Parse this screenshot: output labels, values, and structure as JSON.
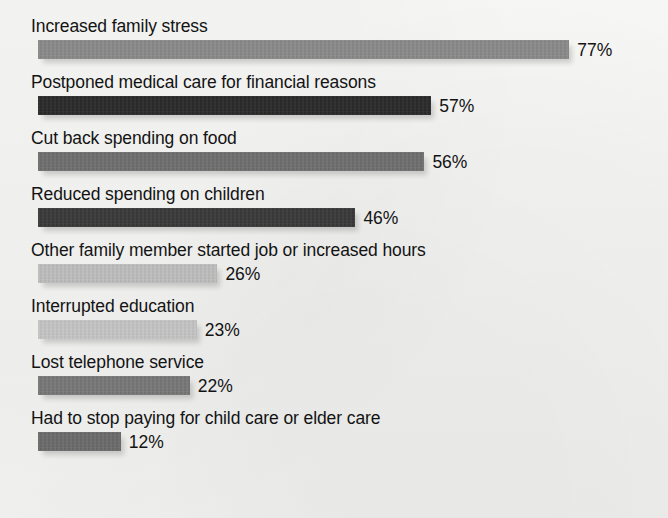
{
  "chart_data": {
    "type": "bar",
    "orientation": "horizontal",
    "title": "",
    "subtitle": "",
    "xlabel": "",
    "ylabel": "",
    "xlim": [
      0,
      100
    ],
    "grid": false,
    "legend": "none",
    "value_suffix": "%",
    "categories": [
      "Increased family stress",
      "Postponed medical care for financial reasons",
      "Cut back spending on food",
      "Reduced spending on children",
      "Other family member started job or increased hours",
      "Interrupted education",
      "Lost telephone service",
      "Had to stop paying for child care or elder care"
    ],
    "values": [
      77,
      57,
      56,
      46,
      26,
      23,
      22,
      12
    ],
    "value_labels": [
      "77%",
      "57%",
      "56%",
      "46%",
      "26%",
      "23%",
      "22%",
      "12%"
    ],
    "bar_colors": [
      "#8a8a8a",
      "#2b2b2b",
      "#6f6f6f",
      "#3a3a3a",
      "#bdbdbd",
      "#c4c4c4",
      "#777777",
      "#6b6b6b"
    ],
    "background_color": "#f4f4f3",
    "text_color": "#131313"
  },
  "chart": {
    "bars": [
      {
        "label": "Increased family stress",
        "value": 77,
        "value_label": "77%",
        "color": "#8a8a8a"
      },
      {
        "label": "Postponed medical care for financial reasons",
        "value": 57,
        "value_label": "57%",
        "color": "#2b2b2b"
      },
      {
        "label": "Cut back spending on food",
        "value": 56,
        "value_label": "56%",
        "color": "#6f6f6f"
      },
      {
        "label": "Reduced spending on children",
        "value": 46,
        "value_label": "46%",
        "color": "#3a3a3a"
      },
      {
        "label": "Other family member started job or increased hours",
        "value": 26,
        "value_label": "26%",
        "color": "#bdbdbd"
      },
      {
        "label": "Interrupted education",
        "value": 23,
        "value_label": "23%",
        "color": "#c4c4c4"
      },
      {
        "label": "Lost telephone service",
        "value": 22,
        "value_label": "22%",
        "color": "#777777"
      },
      {
        "label": "Had to stop paying for child care or elder care",
        "value": 12,
        "value_label": "12%",
        "color": "#6b6b6b"
      }
    ]
  },
  "layout": {
    "row_top_start": 16,
    "row_pitch": 56,
    "bar_left": 38,
    "px_per_percent": 6.9,
    "value_gap": 8
  }
}
